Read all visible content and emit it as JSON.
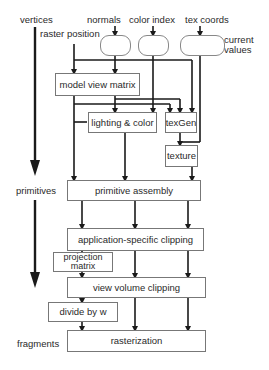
{
  "diagram": {
    "stage_labels": {
      "vertices": "vertices",
      "primitives": "primitives",
      "fragments": "fragments"
    },
    "inputs": {
      "raster_position": "raster position",
      "normals": "normals",
      "color_index": "color index",
      "tex_coords": "tex coords",
      "current_values": "current\nvalues"
    },
    "boxes": {
      "model_view_matrix": "model view matrix",
      "lighting_color": "lighting & color",
      "texgen": "texGen",
      "texture": "texture",
      "primitive_assembly": "primitive assembly",
      "app_clipping": "application-specific clipping",
      "projection_matrix": "projection matrix",
      "view_volume_clipping": "view volume clipping",
      "divide_by_w": "divide by w",
      "rasterization": "rasterization"
    },
    "colors": {
      "line": "#1a1a1a",
      "box_border": "#777777",
      "text": "#2a2a2a"
    }
  }
}
